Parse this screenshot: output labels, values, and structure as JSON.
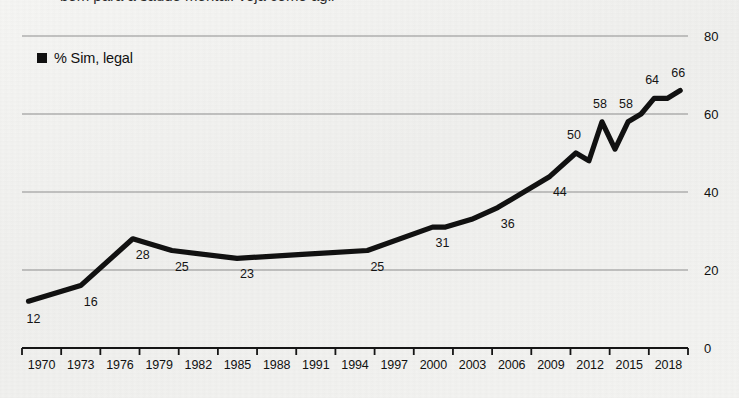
{
  "figure": {
    "title_clipped": "bem para a saúde mental: veja como agir",
    "background_color": "#f3f3f1",
    "line_color": "#111111",
    "gridline_color": "#8d8d8d"
  },
  "legend": {
    "marker": "square-marker",
    "label": "% Sim, legal"
  },
  "chart_data": {
    "type": "line",
    "title": "",
    "xlabel": "",
    "ylabel": "",
    "ylim": [
      0,
      80
    ],
    "yticks": [
      0,
      20,
      40,
      60,
      80
    ],
    "grid": true,
    "legend_position": "top-left",
    "y_axis_side": "right",
    "categories": [
      "1970",
      "1973",
      "1976",
      "1979",
      "1982",
      "1985",
      "1988",
      "1991",
      "1994",
      "1997",
      "2000",
      "2003",
      "2006",
      "2009",
      "2012",
      "2015",
      "2018"
    ],
    "series": [
      {
        "name": "% Sim, legal",
        "x": [
          1969,
          1973,
          1977,
          1980,
          1985,
          1990,
          1995,
          2000,
          2001,
          2003,
          2005,
          2009,
          2011,
          2012,
          2013,
          2014,
          2015,
          2016,
          2017,
          2018,
          2019
        ],
        "values": [
          12,
          16,
          28,
          25,
          23,
          24,
          25,
          31,
          31,
          33,
          36,
          44,
          50,
          48,
          58,
          51,
          58,
          60,
          64,
          64,
          66
        ]
      }
    ],
    "labeled_points": [
      {
        "label": "12",
        "year": 1969,
        "value": 12
      },
      {
        "label": "16",
        "year": 1973,
        "value": 16
      },
      {
        "label": "28",
        "year": 1977,
        "value": 28
      },
      {
        "label": "25",
        "year": 1980,
        "value": 25
      },
      {
        "label": "23",
        "year": 1985,
        "value": 23
      },
      {
        "label": "25",
        "year": 1995,
        "value": 25
      },
      {
        "label": "31",
        "year": 2000,
        "value": 31
      },
      {
        "label": "36",
        "year": 2005,
        "value": 36
      },
      {
        "label": "44",
        "year": 2009,
        "value": 44
      },
      {
        "label": "50",
        "year": 2011,
        "value": 50
      },
      {
        "label": "58",
        "year": 2013,
        "value": 58
      },
      {
        "label": "58",
        "year": 2015,
        "value": 58
      },
      {
        "label": "64",
        "year": 2017,
        "value": 64
      },
      {
        "label": "66",
        "year": 2019,
        "value": 66
      }
    ]
  },
  "axis": {
    "y_labels": [
      "80",
      "60",
      "40",
      "20",
      "0"
    ],
    "x_labels": [
      "1970",
      "1973",
      "1976",
      "1979",
      "1982",
      "1985",
      "1988",
      "1991",
      "1994",
      "1997",
      "2000",
      "2003",
      "2006",
      "2009",
      "2012",
      "2015",
      "2018"
    ]
  }
}
